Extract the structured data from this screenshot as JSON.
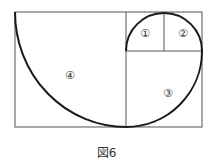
{
  "figure": {
    "caption": "図6",
    "labels": {
      "region1": "①",
      "region2": "②",
      "region3": "③",
      "region4": "④"
    },
    "colors": {
      "line": "#555555",
      "spiral": "#1a1a1a",
      "background": "#ffffff"
    }
  }
}
